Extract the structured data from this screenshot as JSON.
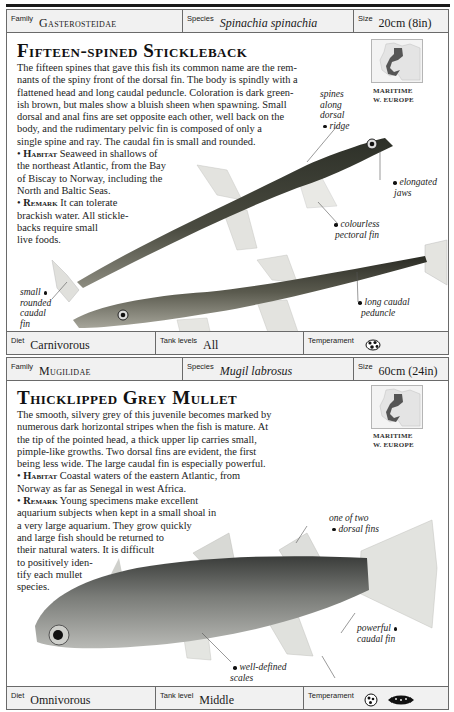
{
  "entries": [
    {
      "family_label": "Family",
      "family": "Gasterosteidae",
      "species_label": "Species",
      "species": "Spinachia spinachia",
      "size_label": "Size",
      "size": "20cm (8in)",
      "title": "Fifteen-spined Stickleback",
      "description": [
        "The fifteen spines that gave this fish its common name are the rem-",
        "nants of the spiny front of the dorsal fin. The body is spindly with a",
        "flattened head and long caudal peduncle. Coloration is dark green-",
        "ish brown, but males show a bluish sheen when spawning. Small",
        "dorsal and anal fins are set opposite each other, well back on the",
        "body, and the rudimentary pelvic fin is composed of only a",
        "single spine and ray. The caudal fin is small and rounded."
      ],
      "habitat_label": "Habitat",
      "habitat": [
        "Seaweed in shallows of",
        "the northeast Atlantic, from the Bay",
        "of Biscay to Norway, including the",
        "North and Baltic Seas."
      ],
      "remark_label": "Remark",
      "remark": [
        "It can tolerate",
        "brackish water. All stickle-",
        "backs require small",
        "live foods."
      ],
      "map_caption": [
        "MARITIME",
        "W. EUROPE"
      ],
      "annotations": {
        "spines": [
          "spines",
          "along",
          "dorsal",
          "ridge"
        ],
        "jaws": [
          "elongated",
          "jaws"
        ],
        "pectoral": [
          "colourless",
          "pectoral fin"
        ],
        "peduncle": [
          "long caudal",
          "peduncle"
        ],
        "caudal": [
          "small",
          "rounded",
          "caudal",
          "fin"
        ]
      },
      "diet_label": "Diet",
      "diet": "Carnivorous",
      "tank_label": "Tank levels",
      "tank": "All",
      "temperament_label": "Temperament",
      "temperament_icons": [
        "aggressive-fish-icon"
      ]
    },
    {
      "family_label": "Family",
      "family": "Mugilidae",
      "species_label": "Species",
      "species": "Mugil labrosus",
      "size_label": "Size",
      "size": "60cm (24in)",
      "title": "Thicklipped Grey Mullet",
      "description": [
        "The smooth, silvery grey of this juvenile becomes marked by",
        "numerous dark horizontal stripes when the fish is mature. At",
        "the tip of the pointed head, a thick upper lip carries small,",
        "pimple-like growths. Two dorsal fins are evident, the first",
        "being less wide. The large caudal fin is especially powerful."
      ],
      "habitat_label": "Habitat",
      "habitat": [
        "Coastal waters of the eastern Atlantic, from",
        "Norway as far as Senegal in west Africa."
      ],
      "remark_label": "Remark",
      "remark": [
        "Young specimens make excellent",
        "aquarium subjects when kept in a small shoal in",
        "a very large aquarium. They grow quickly",
        "and large fish should be returned to",
        "their natural waters. It is difficult",
        "to positively iden-",
        "tify each mullet",
        "species."
      ],
      "map_caption": [
        "MARITIME",
        "W. EUROPE"
      ],
      "annotations": {
        "dorsal": [
          "one of two",
          "dorsal fins"
        ],
        "caudal": [
          "powerful",
          "caudal fin"
        ],
        "scales": [
          "well-defined",
          "scales"
        ]
      },
      "diet_label": "Diet",
      "diet": "Omnivorous",
      "tank_label": "Tank level",
      "tank": "Middle",
      "temperament_label": "Temperament",
      "temperament_icons": [
        "peaceful-fish-icon",
        "schooling-fish-icon"
      ]
    }
  ]
}
